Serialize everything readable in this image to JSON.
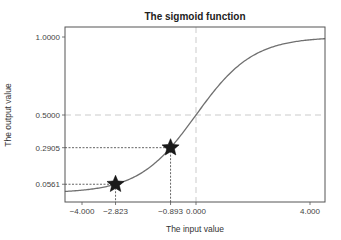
{
  "chart_data": {
    "type": "line",
    "title": "The sigmoid function",
    "xlabel": "The input value",
    "ylabel": "The output value",
    "function": "sigmoid",
    "xlim": [
      -4.6,
      4.53
    ],
    "ylim": [
      -0.055,
      1.065
    ],
    "grid": false,
    "legend": null,
    "x_ticks": [
      -4.0,
      -2.823,
      -0.893,
      0.0,
      4.0
    ],
    "x_tick_labels": [
      "-4.000",
      "-2.823",
      "-0.893",
      "0.000",
      "4.000"
    ],
    "y_ticks": [
      0.0561,
      0.2905,
      0.5,
      1.0
    ],
    "y_tick_labels": [
      "0.0561",
      "0.2905",
      "0.5000",
      "1.0000"
    ],
    "series": [
      {
        "name": "sigmoid",
        "color": "#707070",
        "x_range": [
          -4.6,
          4.53
        ]
      }
    ],
    "highlighted_points": [
      {
        "x": -2.823,
        "y": 0.0561,
        "marker": "star"
      },
      {
        "x": -0.893,
        "y": 0.2905,
        "marker": "star"
      }
    ],
    "reference_lines": [
      {
        "orientation": "vertical",
        "value": 0.0,
        "style": "dashed",
        "color": "#dddddd"
      },
      {
        "orientation": "horizontal",
        "value": 0.5,
        "style": "dashed",
        "color": "#dddddd"
      }
    ],
    "colors": {
      "curve": "#707070",
      "marker": "#1a1a1a",
      "guide": "#222222",
      "reference": "#dddddd",
      "frame": "#555555"
    }
  }
}
